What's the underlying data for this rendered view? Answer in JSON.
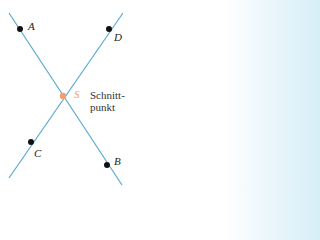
{
  "points": {
    "A": {
      "label": "A",
      "x": 20,
      "y": 29
    },
    "B": {
      "label": "B",
      "x": 107,
      "y": 165
    },
    "C": {
      "label": "C",
      "x": 31,
      "y": 142
    },
    "D": {
      "label": "D",
      "x": 109,
      "y": 29
    },
    "S": {
      "label": "S",
      "x": 63,
      "y": 96
    }
  },
  "caption": {
    "line1": "Schnitt-",
    "line2": "punkt"
  },
  "colors": {
    "line": "#5aa8d0",
    "intersection": "#f0a070",
    "point": "#111111"
  }
}
